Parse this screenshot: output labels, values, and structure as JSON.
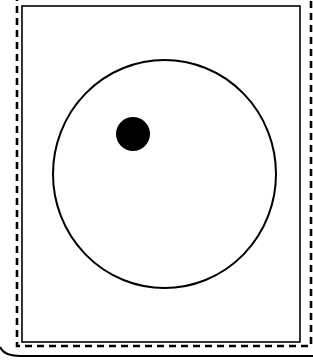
{
  "figure": {
    "width": 313,
    "height": 362,
    "background": "#ffffff",
    "stroke_color": "#000000",
    "dashed_frame": {
      "left": 17,
      "right": 311,
      "top": -6,
      "bottom": 346,
      "dash": "7 5",
      "stroke_width": 2.6
    },
    "inner_rect": {
      "x": 22,
      "y": 6,
      "width": 278,
      "height": 336,
      "stroke_width": 1.6
    },
    "base_line": {
      "y": 356,
      "x_start": 0,
      "x_end": 313,
      "stroke_width": 2.2
    },
    "circle": {
      "cx": 164.5,
      "cy": 174,
      "rx": 111.5,
      "ry": 114,
      "stroke_width": 2
    },
    "dot": {
      "cx": 133,
      "cy": 134,
      "r": 17,
      "fill": "#000000"
    }
  }
}
